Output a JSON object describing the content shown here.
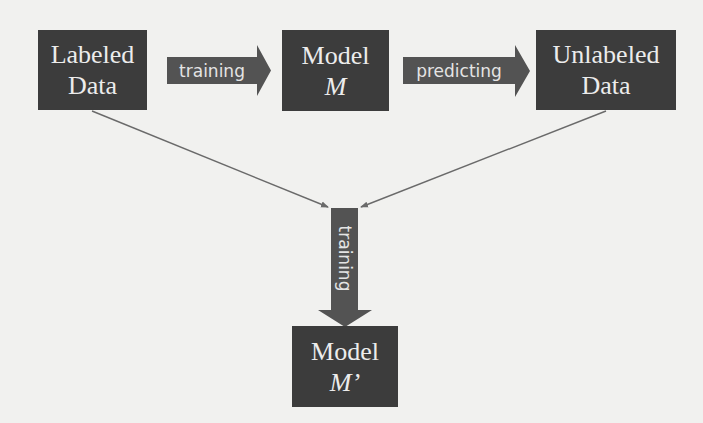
{
  "diagram": {
    "nodes": {
      "labeled_data": {
        "line1": "Labeled",
        "line2": "Data"
      },
      "model_m": {
        "line1": "Model",
        "line2": "M"
      },
      "unlabeled_data": {
        "line1": "Unlabeled",
        "line2": "Data"
      },
      "model_m_prime": {
        "line1": "Model",
        "line2": "M’"
      }
    },
    "edges": {
      "labeled_to_model": {
        "label": "training"
      },
      "model_to_unlabeled": {
        "label": "predicting"
      },
      "merge_to_model_prime": {
        "label": "training"
      }
    },
    "colors": {
      "box_fill": "#3c3c3c",
      "arrow_fill": "#535353",
      "line_stroke": "#6a6a6a",
      "text": "#ececec",
      "background": "#f1f1ef"
    }
  }
}
